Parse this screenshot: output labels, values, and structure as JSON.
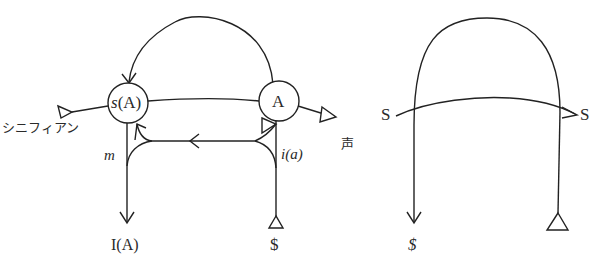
{
  "left_graph": {
    "node_sA": "s(A)",
    "node_sA_prefix": "s",
    "node_sA_suffix": "(A)",
    "node_A": "A",
    "label_signifiant": "シニフィアン",
    "label_voice": "声",
    "label_m": "m",
    "label_ia": "i(a)",
    "label_IA": "I(A)",
    "label_barred_S": "$"
  },
  "right_graph": {
    "label_S_left": "S",
    "label_S_right": "S",
    "label_barred_S": "$"
  },
  "colors": {
    "stroke": "#222222",
    "background": "#ffffff"
  }
}
